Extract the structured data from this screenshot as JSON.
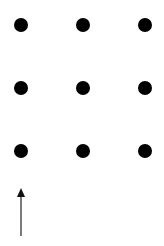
{
  "diagram": {
    "type": "dot-grid-with-arrow",
    "grid": {
      "rows": 3,
      "cols": 3,
      "x": [
        21,
        83,
        145
      ],
      "y": [
        25,
        88,
        151
      ],
      "dot_radius": 7,
      "dot_color": "#000000"
    },
    "arrow": {
      "direction": "up",
      "x": 21,
      "y_start": 236,
      "y_end": 188,
      "color": "#333333"
    },
    "background": "#ffffff"
  }
}
